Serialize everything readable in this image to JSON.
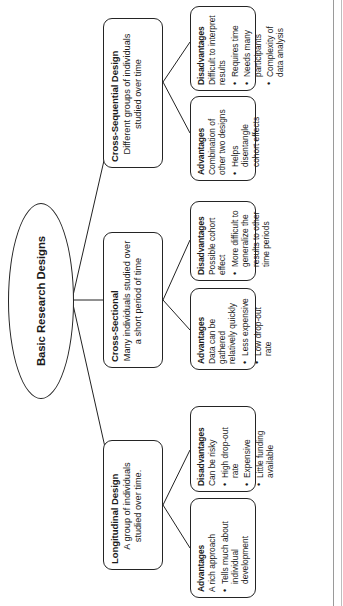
{
  "diagram": {
    "type": "tree",
    "orientation": "rotated-90-ccw",
    "root": {
      "label": "Basic Research Designs",
      "shape": "ellipse"
    },
    "branches": [
      {
        "id": "longitudinal",
        "title": "Longitudinal Design",
        "subtitle": "A group of individuals studied over time.",
        "children": [
          {
            "id": "longitudinal-advantages",
            "header": "Advantages",
            "lead": "A rich approach",
            "bullets": [
              "Tells much about individual development"
            ]
          },
          {
            "id": "longitudinal-disadvantages",
            "header": "Disadvantages",
            "lead": "Can be risky",
            "bullets": [
              "High drop-out rate",
              "Expensive",
              "Little funding available"
            ]
          }
        ]
      },
      {
        "id": "cross-sectional",
        "title": "Cross-Sectional",
        "subtitle": "Many individuals studied over a short period of time",
        "children": [
          {
            "id": "cross-sectional-advantages",
            "header": "Advantages",
            "lead": "Data can be gathered relatively quickly",
            "bullets": [
              "Less expensive",
              "Low drop-out rate"
            ]
          },
          {
            "id": "cross-sectional-disadvantages",
            "header": "Disadvantages",
            "lead": "Possible cohort effect",
            "bullets": [
              "More difficult to generalize the results to other time periods"
            ]
          }
        ]
      },
      {
        "id": "cross-sequential",
        "title": "Cross-Sequential Design",
        "subtitle": "Different groups of individuals studied over time",
        "children": [
          {
            "id": "cross-sequential-advantages",
            "header": "Advantages",
            "lead": "Combination of other two designs",
            "bullets": [
              "Helps disentangle cohort effects"
            ]
          },
          {
            "id": "cross-sequential-disadvantages",
            "header": "Disadvantages",
            "lead": "Difficult to interpret results",
            "bullets": [
              "Requires time",
              "Needs many participants",
              "Complexity of data analysis"
            ]
          }
        ]
      }
    ],
    "colors": {
      "stroke": "#242424",
      "text": "#1a1a1a",
      "background": "#ffffff"
    }
  }
}
